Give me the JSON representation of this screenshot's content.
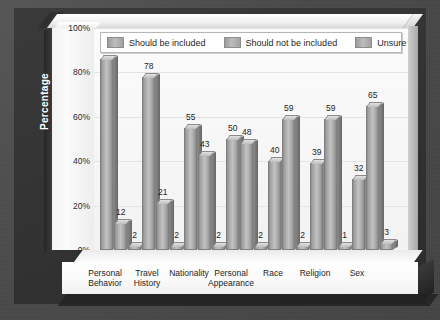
{
  "chart_data": {
    "type": "bar",
    "title": "",
    "xlabel": "",
    "ylabel": "Percentage",
    "ylim": [
      0,
      100
    ],
    "ytick_labels": [
      "0%",
      "20%",
      "40%",
      "60%",
      "80%",
      "100%"
    ],
    "ytick_values": [
      0,
      20,
      40,
      60,
      80,
      100
    ],
    "grid": true,
    "legend_position": "top",
    "categories": [
      "Personal Behavior",
      "Travel History",
      "Nationality",
      "Personal Appearance",
      "Race",
      "Religion",
      "Sex"
    ],
    "category_lines": [
      [
        "Personal",
        "Behavior"
      ],
      [
        "Travel",
        "History"
      ],
      [
        "Nationality",
        ""
      ],
      [
        "Personal",
        "Appearance"
      ],
      [
        "Race",
        ""
      ],
      [
        "Religion",
        ""
      ],
      [
        "Sex",
        ""
      ]
    ],
    "series": [
      {
        "name": "Should be included",
        "values": [
          86,
          78,
          55,
          50,
          40,
          39,
          32
        ],
        "color": "#b0b0b0"
      },
      {
        "name": "Should not be included",
        "values": [
          12,
          21,
          43,
          48,
          59,
          59,
          65
        ],
        "color": "#b0b0b0"
      },
      {
        "name": "Unsure",
        "values": [
          2,
          2,
          2,
          2,
          2,
          1,
          3
        ],
        "color": "#b0b0b0"
      }
    ]
  },
  "legend": {
    "items": [
      {
        "label": "Should be included"
      },
      {
        "label": "Should not be included"
      },
      {
        "label": "Unsure"
      }
    ]
  },
  "axis": {
    "y_title": "Percentage"
  },
  "colors": {
    "backdrop": "#4a4a4a",
    "panel": "#333333",
    "plot_area": "#fafafa",
    "bar": "#b0b0b0",
    "gridline": "#e3e3e3",
    "text": "#1d1d1d"
  }
}
